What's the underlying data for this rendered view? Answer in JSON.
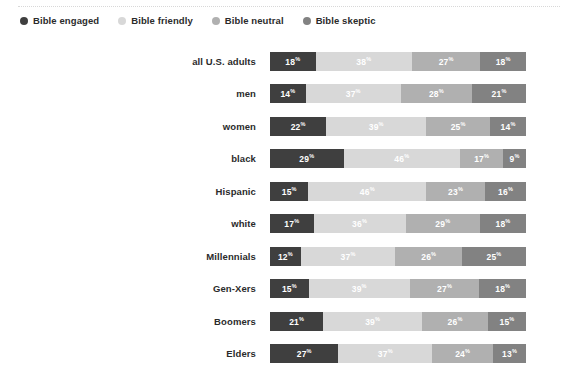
{
  "legend": {
    "items": [
      {
        "label": "Bible engaged",
        "color": "#3f3f3f",
        "icon": "legend-dot-icon"
      },
      {
        "label": "Bible friendly",
        "color": "#d8d8d8",
        "icon": "legend-dot-icon"
      },
      {
        "label": "Bible neutral",
        "color": "#b0b0b0",
        "icon": "legend-dot-icon"
      },
      {
        "label": "Bible skeptic",
        "color": "#828282",
        "icon": "legend-dot-icon"
      }
    ]
  },
  "colors": {
    "engaged": "#3f3f3f",
    "friendly": "#d8d8d8",
    "neutral": "#b0b0b0",
    "skeptic": "#828282",
    "background": "#ffffff",
    "label_text": "#2b2b2b",
    "value_text": "#ffffff",
    "rule": "#d8d8d8"
  },
  "chart_data": {
    "type": "bar",
    "orientation": "horizontal",
    "stacked": true,
    "title": "",
    "subtitle": "",
    "xlabel": "",
    "ylabel": "",
    "xlim": [
      0,
      100
    ],
    "grid": false,
    "legend_position": "top-left",
    "unit": "%",
    "categories": [
      "all U.S. adults",
      "men",
      "women",
      "black",
      "Hispanic",
      "white",
      "Millennials",
      "Gen-Xers",
      "Boomers",
      "Elders"
    ],
    "series": [
      {
        "name": "Bible engaged",
        "color": "#3f3f3f",
        "values": [
          18,
          14,
          22,
          29,
          15,
          17,
          12,
          15,
          21,
          27
        ]
      },
      {
        "name": "Bible friendly",
        "color": "#d8d8d8",
        "values": [
          38,
          37,
          39,
          46,
          46,
          36,
          37,
          39,
          39,
          37
        ]
      },
      {
        "name": "Bible neutral",
        "color": "#b0b0b0",
        "values": [
          27,
          28,
          25,
          17,
          23,
          29,
          26,
          27,
          26,
          24
        ]
      },
      {
        "name": "Bible skeptic",
        "color": "#828282",
        "values": [
          18,
          21,
          14,
          9,
          16,
          18,
          25,
          18,
          15,
          13
        ]
      }
    ]
  }
}
